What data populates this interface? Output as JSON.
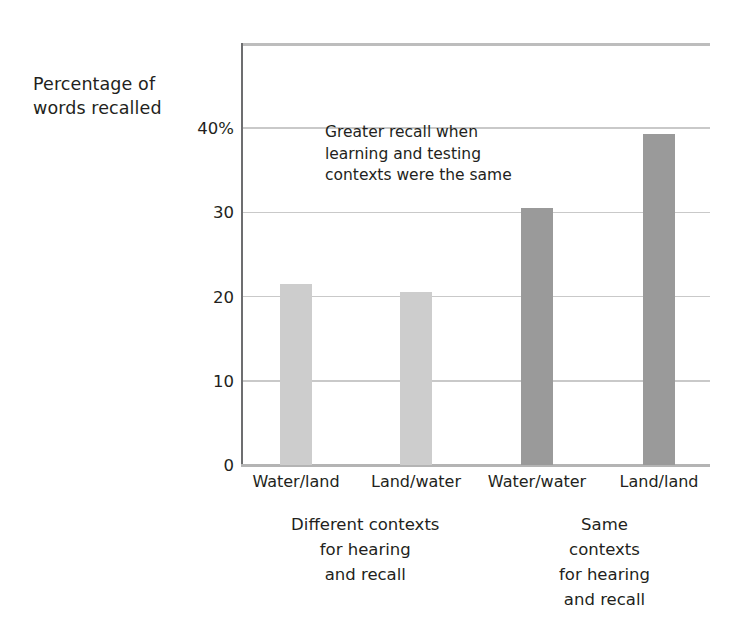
{
  "chart_data": {
    "type": "bar",
    "title": "",
    "subtitle": "",
    "xlabel": "",
    "ylabel": "Percentage of\nwords recalled",
    "categories": [
      "Water/land",
      "Land/water",
      "Water/water",
      "Land/land"
    ],
    "values": [
      21.5,
      20.6,
      30.5,
      39.3
    ],
    "series": [
      {
        "name": "Percentage of words recalled",
        "values": [
          21.5,
          20.6,
          30.5,
          39.3
        ]
      }
    ],
    "bar_colors": [
      "#cdcdcd",
      "#cdcdcd",
      "#9a9a9a",
      "#9a9a9a"
    ],
    "ylim": [
      0,
      44
    ],
    "yticks": [
      0,
      10,
      20,
      30,
      40
    ],
    "ytick_labels": [
      "0",
      "10",
      "20",
      "30",
      "40%"
    ],
    "grid": true,
    "gridlines_at": [
      10,
      20,
      30,
      40
    ],
    "legend": "none",
    "annotations": [
      {
        "text": "Greater recall when\nlearning and testing\ncontexts were the same",
        "x_value": 1.35,
        "y_value": 40
      }
    ],
    "groups": [
      {
        "label": "Different contexts\nfor hearing\nand recall",
        "categories": [
          "Water/land",
          "Land/water"
        ],
        "center_fraction": 0.265
      },
      {
        "label": "Same contexts\nfor hearing\nand recall",
        "categories": [
          "Water/water",
          "Land/land"
        ],
        "center_fraction": 0.775
      }
    ]
  },
  "colors": {
    "background": "#ffffff",
    "text": "#231f20",
    "gridline": "#c9c9c9",
    "axis": "#6d6e70",
    "bar_light": "#cdcdcd",
    "bar_dark": "#9a9a9a"
  }
}
